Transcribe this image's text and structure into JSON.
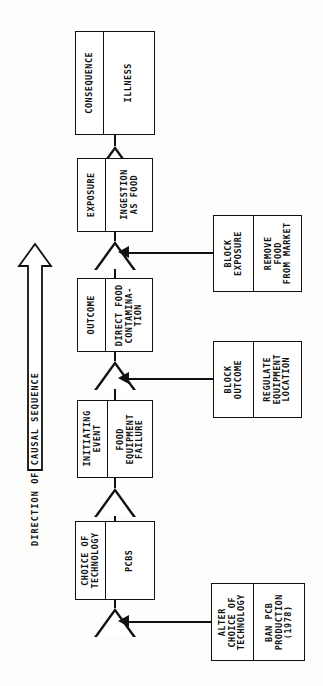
{
  "diagram": {
    "direction_arrow": {
      "label": "DIRECTION OF CAUSAL SEQUENCE",
      "points": "up"
    },
    "chain": [
      {
        "id": "consequence",
        "stage_label": "CONSEQUENCE",
        "value": "ILLNESS"
      },
      {
        "id": "exposure",
        "stage_label": "EXPOSURE",
        "value": "INGESTION\nAS FOOD"
      },
      {
        "id": "outcome",
        "stage_label": "OUTCOME",
        "value": "DIRECT FOOD\nCONTAMINA-\nTION"
      },
      {
        "id": "initiating-event",
        "stage_label": "INITIATING\nEVENT",
        "value": "FOOD\nEQUIPMENT\nFAILURE"
      },
      {
        "id": "choice-of-technology",
        "stage_label": "CHOICE OF\nTECHNOLOGY",
        "value": "PCBS"
      }
    ],
    "interventions": [
      {
        "id": "block-exposure",
        "stage_label": "BLOCK\nEXPOSURE",
        "value": "REMOVE\nFOOD\nFROM MARKET"
      },
      {
        "id": "block-outcome",
        "stage_label": "BLOCK\nOUTCOME",
        "value": "REGULATE\nEQUIPMENT\nLOCATION"
      },
      {
        "id": "alter-choice-of-technology",
        "stage_label": "ALTER\nCHOICE OF\nTECHNOLOGY",
        "value": "BAN PCB\nPRODUCTION\n(1978)"
      }
    ],
    "colors": {
      "ink": "#111111",
      "paper": "#fdfdfc"
    }
  }
}
